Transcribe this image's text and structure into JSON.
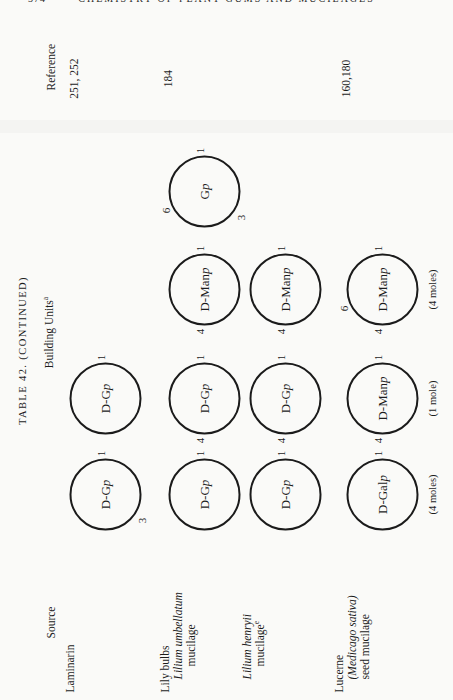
{
  "page": {
    "page_number": "374",
    "running_title": "CHEMISTRY OF PLANT GUMS AND MUCILAGES"
  },
  "table": {
    "title": "TABLE 42. (CONTINUED)",
    "columns": {
      "source": "Source",
      "building_units": {
        "text": "Building Units",
        "footnote": "a"
      },
      "reference": "Reference"
    },
    "rows": [
      {
        "source_lines": [
          {
            "text": "Laminarin",
            "italic": false,
            "indent": 0,
            "sup": ""
          }
        ],
        "reference": "251, 252",
        "units": [
          {
            "col": 1,
            "label": "D-Gp",
            "links": [
              {
                "n": "3",
                "pos": "bl"
              },
              {
                "n": "1",
                "pos": "r"
              }
            ],
            "mole": ""
          },
          {
            "col": 2,
            "label": "D-Gp",
            "links": [
              {
                "n": "1",
                "pos": "r"
              }
            ],
            "mole": ""
          }
        ]
      },
      {
        "source_lines": [
          {
            "text": "Lily bulbs",
            "italic": false,
            "indent": 0,
            "sup": ""
          },
          {
            "text": "Lilium umbellatum",
            "italic": true,
            "indent": 1,
            "sup": ""
          },
          {
            "text": "mucilage",
            "italic": false,
            "indent": 2,
            "sup": ""
          }
        ],
        "reference": "184",
        "units": [
          {
            "col": 1,
            "label": "D-Gp",
            "links": [
              {
                "n": "1",
                "pos": "r"
              }
            ],
            "mole": ""
          },
          {
            "col": 2,
            "label": "D-Gp",
            "links": [
              {
                "n": "4",
                "pos": "l"
              },
              {
                "n": "1",
                "pos": "r"
              }
            ],
            "mole": ""
          },
          {
            "col": 3,
            "label": "D-Manp",
            "links": [
              {
                "n": "4",
                "pos": "l"
              },
              {
                "n": "1",
                "pos": "r"
              }
            ],
            "mole": ""
          },
          {
            "col": 4,
            "label": "Gp",
            "links": [
              {
                "n": "6",
                "pos": "tl"
              },
              {
                "n": "3",
                "pos": "bl"
              },
              {
                "n": "1",
                "pos": "r"
              }
            ],
            "mole": ""
          }
        ]
      },
      {
        "source_lines": [
          {
            "text": "Lilium henryii",
            "italic": true,
            "indent": 1,
            "sup": ""
          },
          {
            "text": "mucilage",
            "italic": false,
            "indent": 2,
            "sup": "e"
          }
        ],
        "reference": "",
        "units": [
          {
            "col": 1,
            "label": "D-Gp",
            "links": [
              {
                "n": "1",
                "pos": "r"
              }
            ],
            "mole": ""
          },
          {
            "col": 2,
            "label": "D-Gp",
            "links": [
              {
                "n": "4",
                "pos": "l"
              },
              {
                "n": "1",
                "pos": "r"
              }
            ],
            "mole": ""
          },
          {
            "col": 3,
            "label": "D-Manp",
            "links": [
              {
                "n": "4",
                "pos": "l"
              },
              {
                "n": "1",
                "pos": "r"
              }
            ],
            "mole": ""
          }
        ]
      },
      {
        "source_lines": [
          {
            "text": "Lucerne",
            "italic": false,
            "indent": 0,
            "sup": ""
          },
          {
            "text": "(Medicago sativa)",
            "italic": true,
            "indent": 1,
            "sup": ""
          },
          {
            "text": "seed mucilage",
            "italic": false,
            "indent": 1,
            "sup": ""
          }
        ],
        "reference": "160,180",
        "units": [
          {
            "col": 1,
            "label": "D-Galp",
            "links": [
              {
                "n": "1",
                "pos": "r"
              }
            ],
            "mole": "(4 moles)"
          },
          {
            "col": 2,
            "label": "D-Manp",
            "links": [
              {
                "n": "4",
                "pos": "l"
              },
              {
                "n": "1",
                "pos": "r"
              }
            ],
            "mole": "(1 mole)"
          },
          {
            "col": 3,
            "label": "D-Manp",
            "links": [
              {
                "n": "6",
                "pos": "tl"
              },
              {
                "n": "4",
                "pos": "l"
              },
              {
                "n": "1",
                "pos": "r"
              }
            ],
            "mole": "(4 moles)"
          }
        ]
      }
    ]
  }
}
